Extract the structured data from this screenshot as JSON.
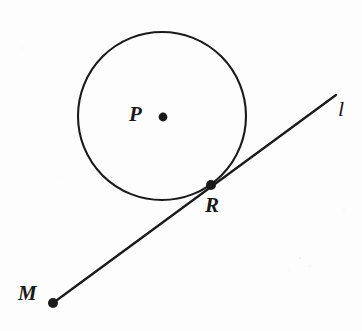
{
  "figure": {
    "kind": "geometry-diagram",
    "width": 362,
    "height": 331,
    "background_color": "#fdfdfd",
    "ink_color": "#1a1a1a"
  },
  "labels": {
    "center_point": "P",
    "tangent_point": "R",
    "exterior_point": "M",
    "line": "l"
  },
  "geometry": {
    "circle": {
      "name": "circle-P",
      "center_x": 162,
      "center_y": 116,
      "radius": 84,
      "stroke_width": 2.1
    },
    "points": [
      {
        "name": "P",
        "x": 163,
        "y": 117,
        "dot_radius": 4.4,
        "label_x": 137,
        "label_y": 114
      },
      {
        "name": "R",
        "x": 211,
        "y": 185,
        "dot_radius": 5.0,
        "label_x": 213,
        "label_y": 205
      },
      {
        "name": "M",
        "x": 53,
        "y": 303,
        "dot_radius": 5.0,
        "label_x": 29,
        "label_y": 292
      }
    ],
    "line": {
      "name": "line-l",
      "x1": 53,
      "y1": 303,
      "x2": 336,
      "y2": 95,
      "stroke_width": 2.3,
      "label_x": 344,
      "label_y": 110
    }
  }
}
